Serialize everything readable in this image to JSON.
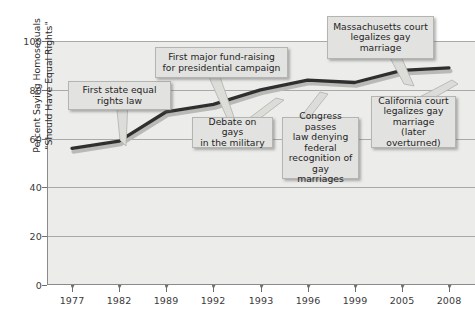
{
  "chart_data": {
    "type": "line",
    "title": "",
    "xlabel": "",
    "ylabel": "Percent Saying Homosexuals\n\"Should Have Equal Rights\"",
    "categories": [
      "1977",
      "1982",
      "1989",
      "1992",
      "1993",
      "1996",
      "1999",
      "2005",
      "2008"
    ],
    "x": [
      1977,
      1982,
      1989,
      1992,
      1993,
      1996,
      1999,
      2005,
      2008
    ],
    "values": [
      56,
      59,
      71,
      74,
      80,
      84,
      83,
      88,
      89
    ],
    "series": [
      {
        "name": "Percent Saying Homosexuals Should Have Equal Rights",
        "values": [
          56,
          59,
          71,
          74,
          80,
          84,
          83,
          88,
          89
        ]
      }
    ],
    "ylim": [
      0,
      100
    ],
    "yticks": [
      0,
      20,
      40,
      60,
      80,
      100
    ],
    "ytick_labels": [
      "0",
      "20",
      "40",
      "60",
      "80",
      "100"
    ],
    "grid": true,
    "legend": "none",
    "line_color": "#2f2f2f",
    "plot_background": "#ececeb",
    "gridline_color": "#a9a9a6",
    "annotations": [
      {
        "id": "first-state-equal-rights-law",
        "text": "First state equal\nrights law",
        "points_to_year": 1982,
        "points_to_value": 59
      },
      {
        "id": "first-major-fund-raising",
        "text": "First major fund-raising\nfor presidential campaign",
        "points_to_year": 1989,
        "points_to_value": 74
      },
      {
        "id": "debate-on-gays-in-the-military",
        "text": "Debate on gays\nin the military",
        "points_to_year": 1993,
        "points_to_value": 80
      },
      {
        "id": "congress-passes-law",
        "text": "Congress passes\nlaw denying\nfederal\nrecognition of\ngay marriages",
        "points_to_year": 1996,
        "points_to_value": 84
      },
      {
        "id": "massachusetts-court",
        "text": "Massachusetts court\nlegalizes gay\nmarriage",
        "points_to_year": 2005,
        "points_to_value": 88
      },
      {
        "id": "california-court",
        "text": "California court\nlegalizes gay\nmarriage\n(later overturned)",
        "points_to_year": 2008,
        "points_to_value": 89
      }
    ]
  }
}
